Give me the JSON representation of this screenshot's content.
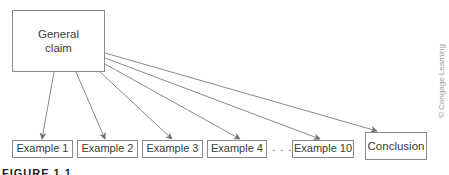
{
  "diagram": {
    "source": {
      "label": "General claim"
    },
    "targets": [
      {
        "label": "Example 1"
      },
      {
        "label": "Example 2"
      },
      {
        "label": "Example 3"
      },
      {
        "label": "Example 4"
      },
      {
        "label": "Example 10"
      },
      {
        "label": "Conclusion"
      }
    ],
    "ellipsis": ". . .",
    "credit": "© Cengage Learning",
    "figure_label": "FIGURE 1.1",
    "colors": {
      "arrow": "#7a7a7a",
      "box_border": "#8a8a8a"
    }
  }
}
